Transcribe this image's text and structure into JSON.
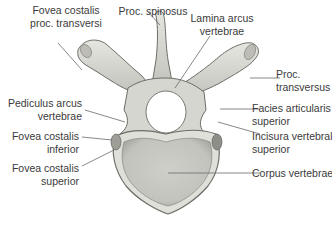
{
  "figure": {
    "labels": {
      "fovea_costalis_proc_transversi": [
        "Fovea costalis",
        "proc. transversi"
      ],
      "proc_spinosus": [
        "Proc. spinosus"
      ],
      "lamina_arcus_vertebrae": [
        "Lamina arcus",
        "vertebrae"
      ],
      "proc_transversus": [
        "Proc.",
        "transversus"
      ],
      "pediculus_arcus_vertebrae": [
        "Pediculus arcus",
        "vertebrae"
      ],
      "facies_articularis_superior": [
        "Facies articularis",
        "superior"
      ],
      "fovea_costalis_inferior": [
        "Fovea costalis",
        "inferior"
      ],
      "incisura_vertebralis_superior": [
        "Incisura vertebralis",
        "superior"
      ],
      "fovea_costalis_superior": [
        "Fovea costalis",
        "superior"
      ],
      "corpus_vertebrae": [
        "Corpus vertebrae"
      ]
    },
    "colors": {
      "bone_fill": "#dcdcd6",
      "bone_shade": "#b9b9b2",
      "bone_outline": "#6e6e68",
      "leader_line": "#6a6a6a",
      "text": "#3a3a3a"
    }
  }
}
